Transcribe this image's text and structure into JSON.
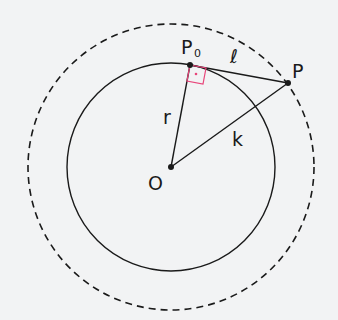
{
  "diagram": {
    "labels": {
      "P0": "P",
      "P0_sub": "0",
      "ell": "ℓ",
      "P": "P",
      "r": "r",
      "k": "k",
      "O": "O"
    },
    "colors": {
      "line": "#1a1a1a",
      "right_angle": "#e8457a",
      "background": "#f2f3f4"
    },
    "geometry": {
      "center": [
        171,
        167
      ],
      "inner_radius": 104,
      "outer_radius": 143,
      "P0": [
        190,
        65
      ],
      "P": [
        288,
        83
      ]
    }
  }
}
